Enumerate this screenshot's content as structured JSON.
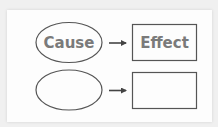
{
  "diagram": {
    "rows": [
      {
        "cause_label": "Cause",
        "effect_label": "Effect"
      },
      {
        "cause_label": "",
        "effect_label": ""
      }
    ]
  },
  "colors": {
    "background": "#f0f0f0",
    "card": "#fdfdfd",
    "outline": "#555555",
    "text": "#7a7a7a",
    "arrow": "#444444"
  }
}
